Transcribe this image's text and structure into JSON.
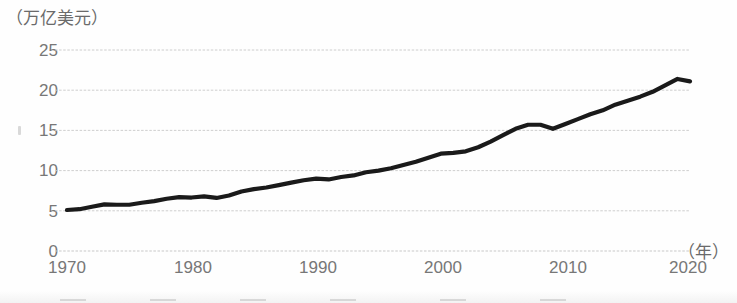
{
  "chart_data": {
    "type": "line",
    "title": "",
    "subtitle": "",
    "xlabel": "（年）",
    "ylabel": "（万亿美元）",
    "xlim": [
      1970,
      2020
    ],
    "ylim": [
      0,
      25
    ],
    "grid": true,
    "legend": null,
    "x_ticks": [
      "1970",
      "1980",
      "1990",
      "2000",
      "2010",
      "2020"
    ],
    "x_tick_values": [
      1970,
      1980,
      1990,
      2000,
      2010,
      2020
    ],
    "y_ticks": [
      "0",
      "5",
      "10",
      "15",
      "20",
      "25"
    ],
    "y_tick_values": [
      0,
      5,
      10,
      15,
      20,
      25
    ],
    "line_color": "#1a1a1a",
    "grid_color": "#c8c8c8",
    "series": [
      {
        "name": "",
        "x": [
          1970,
          1971,
          1972,
          1973,
          1974,
          1975,
          1976,
          1977,
          1978,
          1979,
          1980,
          1981,
          1982,
          1983,
          1984,
          1985,
          1986,
          1987,
          1988,
          1989,
          1990,
          1991,
          1992,
          1993,
          1994,
          1995,
          1996,
          1997,
          1998,
          1999,
          2000,
          2001,
          2002,
          2003,
          2004,
          2005,
          2006,
          2007,
          2008,
          2009,
          2010,
          2011,
          2012,
          2013,
          2014,
          2015,
          2016,
          2017,
          2018,
          2019,
          2020
        ],
        "values": [
          5.1,
          5.2,
          5.5,
          5.8,
          5.75,
          5.75,
          6.0,
          6.2,
          6.5,
          6.7,
          6.65,
          6.8,
          6.6,
          6.9,
          7.4,
          7.7,
          7.9,
          8.2,
          8.5,
          8.8,
          9.0,
          8.9,
          9.2,
          9.4,
          9.8,
          10.0,
          10.3,
          10.7,
          11.1,
          11.6,
          12.1,
          12.2,
          12.4,
          12.9,
          13.6,
          14.4,
          15.2,
          15.7,
          15.7,
          15.2,
          15.8,
          16.4,
          17.0,
          17.5,
          18.2,
          18.7,
          19.2,
          19.8,
          20.6,
          21.4,
          21.1
        ]
      }
    ]
  },
  "axes": {
    "unit_label": "（万亿美元）",
    "year_label": "（年）"
  }
}
